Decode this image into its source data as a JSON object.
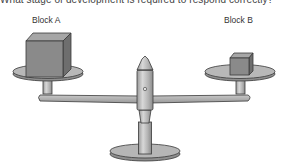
{
  "question": {
    "text": "What stage of development is required to respond correctly?"
  },
  "diagram": {
    "type": "balance-scale",
    "left_block": {
      "label": "Block A",
      "size": "large"
    },
    "right_block": {
      "label": "Block B",
      "size": "small"
    },
    "colors": {
      "block_front": "#8a8a8a",
      "block_top": "#a8a8a8",
      "block_side": "#6e6e6e",
      "metal": "#b8b8b8",
      "outline": "#3a3a3a"
    }
  }
}
